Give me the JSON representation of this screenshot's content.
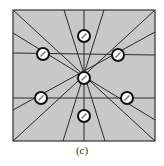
{
  "figure": {
    "caption": "(c)",
    "square": {
      "x": 13,
      "y": 10,
      "width": 142,
      "height": 131,
      "fill": "#c8c8c8",
      "stroke": "#333333"
    },
    "line_color": "#2a2a2a",
    "circle_style": {
      "radius": 6,
      "fill": "#ffffff",
      "stroke": "#111111",
      "stroke_width": 2
    },
    "nodes": [
      {
        "id": "top",
        "cx": 84,
        "cy": 36
      },
      {
        "id": "upper-left",
        "cx": 43,
        "cy": 54
      },
      {
        "id": "upper-right",
        "cx": 118,
        "cy": 55
      },
      {
        "id": "center",
        "cx": 84,
        "cy": 78
      },
      {
        "id": "lower-left",
        "cx": 41,
        "cy": 98
      },
      {
        "id": "lower-right",
        "cx": 127,
        "cy": 98
      },
      {
        "id": "bottom",
        "cx": 84,
        "cy": 116
      }
    ],
    "lines": [
      {
        "x1": 84,
        "y1": 10,
        "x2": 84,
        "y2": 141
      },
      {
        "x1": 13,
        "y1": 53,
        "x2": 155,
        "y2": 55
      },
      {
        "x1": 13,
        "y1": 98,
        "x2": 155,
        "y2": 98
      },
      {
        "x1": 64,
        "y1": 10,
        "x2": 105,
        "y2": 141
      },
      {
        "x1": 104,
        "y1": 10,
        "x2": 63,
        "y2": 141
      },
      {
        "x1": 13,
        "y1": 10,
        "x2": 155,
        "y2": 141
      },
      {
        "x1": 13,
        "y1": 141,
        "x2": 155,
        "y2": 10
      },
      {
        "x1": 13,
        "y1": 33,
        "x2": 155,
        "y2": 120
      },
      {
        "x1": 155,
        "y1": 32,
        "x2": 13,
        "y2": 110
      }
    ]
  }
}
